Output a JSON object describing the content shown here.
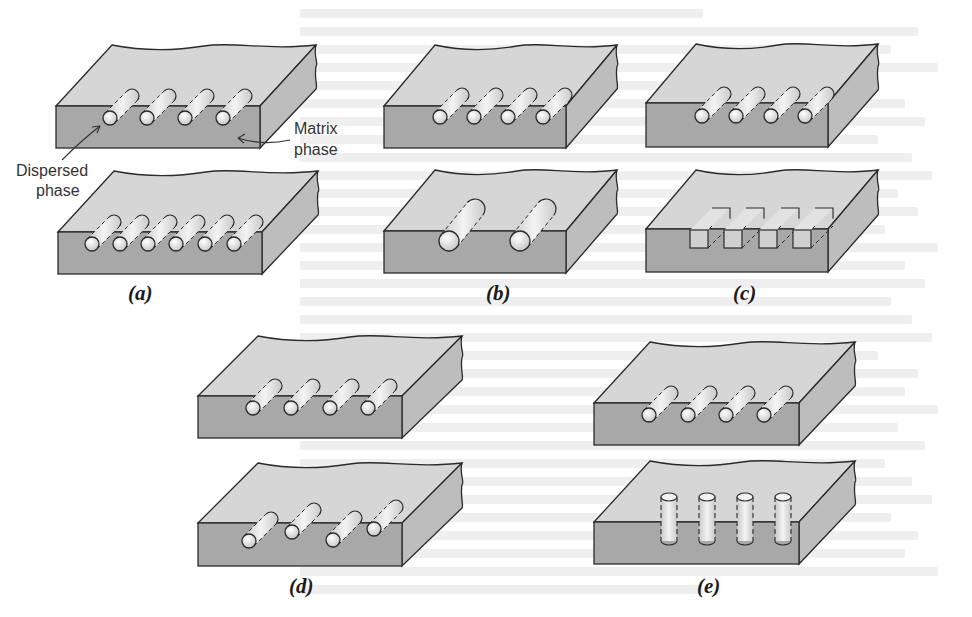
{
  "figure": {
    "annotations": {
      "dispersed_label_line1": "Dispersed",
      "dispersed_label_line2": "phase",
      "matrix_label_line1": "Matrix",
      "matrix_label_line2": "phase"
    },
    "panels": [
      {
        "id": "a",
        "label": "(a)",
        "characteristic": "concentration",
        "top": {
          "fiber_count": 4,
          "shape": "round",
          "orientation": "parallel-depth"
        },
        "bottom": {
          "fiber_count": 6,
          "shape": "round",
          "orientation": "parallel-depth"
        }
      },
      {
        "id": "b",
        "label": "(b)",
        "characteristic": "size",
        "top": {
          "fiber_count": 4,
          "shape": "round",
          "size": "small"
        },
        "bottom": {
          "fiber_count": 2,
          "shape": "round",
          "size": "large"
        }
      },
      {
        "id": "c",
        "label": "(c)",
        "characteristic": "shape",
        "top": {
          "fiber_count": 4,
          "shape": "round"
        },
        "bottom": {
          "fiber_count": 4,
          "shape": "square"
        }
      },
      {
        "id": "d",
        "label": "(d)",
        "characteristic": "distribution",
        "top": {
          "fiber_count": 4,
          "arrangement": "uniform"
        },
        "bottom": {
          "fiber_count": 4,
          "arrangement": "non-uniform"
        }
      },
      {
        "id": "e",
        "label": "(e)",
        "characteristic": "orientation",
        "top": {
          "fiber_count": 4,
          "orientation": "horizontal"
        },
        "bottom": {
          "fiber_count": 4,
          "orientation": "vertical"
        }
      }
    ],
    "colors": {
      "front_face": "#a8a8a8",
      "top_face": "#d6d6d6",
      "side_face": "#bdbdbd",
      "fiber_fill": "#ececec",
      "outline": "#2a2a2a"
    }
  }
}
